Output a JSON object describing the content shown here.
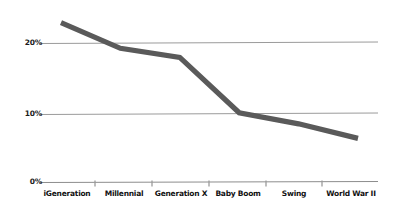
{
  "chart_data": {
    "type": "line",
    "title": "",
    "subtitle": "",
    "xlabel": "",
    "ylabel": "",
    "categories": [
      "iGeneration",
      "Millennial",
      "Generation X",
      "Baby Boom",
      "Swing",
      "World War II"
    ],
    "series": [
      {
        "name": "Share",
        "values": [
          23,
          19.3,
          18,
          10,
          8.4,
          6.3
        ]
      }
    ],
    "y_ticks": [
      "0%",
      "10%",
      "20%"
    ],
    "y_tick_values": [
      0,
      10,
      20
    ],
    "ylim": [
      0,
      25
    ],
    "grid": true,
    "legend": "none",
    "line_color": "#5a5a5a",
    "grid_color": "#9b9b9b",
    "axis_color": "#8d8d8d",
    "label_color": "#111111"
  },
  "axes": {
    "y_labels": [
      {
        "text": "20%",
        "value": 20
      },
      {
        "text": "10%",
        "value": 10
      },
      {
        "text": "0%",
        "value": 0
      }
    ],
    "x_labels": [
      {
        "text": "iGeneration"
      },
      {
        "text": "Millennial"
      },
      {
        "text": "Generation X"
      },
      {
        "text": "Baby Boom"
      },
      {
        "text": "Swing"
      },
      {
        "text": "World War II"
      }
    ]
  }
}
